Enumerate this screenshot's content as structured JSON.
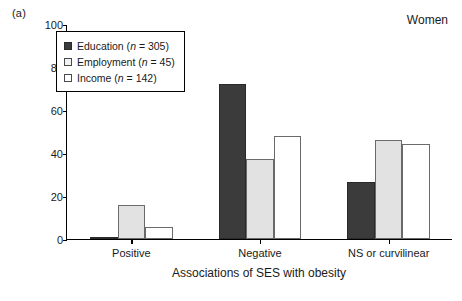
{
  "panel_label": "(a)",
  "annotation": "Women",
  "legend": {
    "items": [
      {
        "key": "education",
        "label": "Education",
        "n_prefix": "(",
        "n_text": "n",
        "n_value": " = 305)",
        "swatch": "dark-filled-square"
      },
      {
        "key": "employment",
        "label": "Employment",
        "n_prefix": "(",
        "n_text": "n",
        "n_value": " = 45)",
        "swatch": "light-outlined-square"
      },
      {
        "key": "income",
        "label": "Income",
        "n_prefix": "(",
        "n_text": "n",
        "n_value": " = 142)",
        "swatch": "white-outlined-square"
      }
    ]
  },
  "colors": {
    "education": "#3b3b3b",
    "employment": "#e2e2e2",
    "income": "#ffffff",
    "axis": "#000000"
  },
  "chart_data": {
    "type": "bar",
    "title": "",
    "subtitle": "",
    "xlabel": "Associations of SES with obesity",
    "ylabel": "Percentage of studies",
    "categories": [
      "Positive",
      "Negative",
      "NS or curvilinear"
    ],
    "series": [
      {
        "name": "Education (n = 305)",
        "values": [
          1,
          72,
          26.5
        ]
      },
      {
        "name": "Employment (n = 45)",
        "values": [
          16,
          37,
          46
        ]
      },
      {
        "name": "Income (n = 142)",
        "values": [
          5.5,
          48,
          44
        ]
      }
    ],
    "ylim": [
      0,
      100
    ],
    "yticks": [
      0,
      20,
      40,
      60,
      80,
      100
    ],
    "ytick_labels": [
      "0",
      "20",
      "40",
      "60",
      "80",
      "100"
    ],
    "grid": false,
    "legend_position": "upper-left-inset",
    "annotations": [
      "Women",
      "(a)"
    ]
  }
}
